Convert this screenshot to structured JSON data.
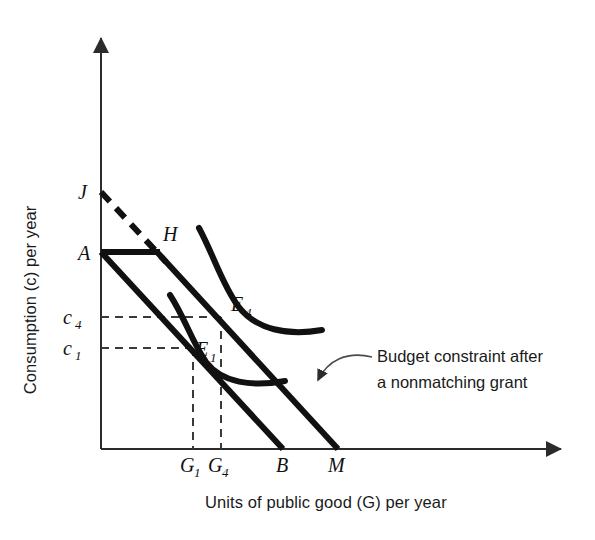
{
  "figure": {
    "background_color": "#ffffff",
    "line_color": "#111111",
    "axis_color": "#2b2b2b",
    "guide_color": "#3a3a3a"
  },
  "axes": {
    "y_title": "Consumption (c) per year",
    "x_title": "Units of public good (G) per year",
    "origin": {
      "x": 101,
      "y": 449
    },
    "x_axis_end": {
      "x": 566,
      "y": 449
    },
    "y_axis_top": {
      "x": 101,
      "y": 33
    }
  },
  "y_ticks": [
    {
      "label": "c",
      "sub": "4",
      "value_y": 317
    },
    {
      "label": "c",
      "sub": "1",
      "value_y": 348
    }
  ],
  "x_ticks": [
    {
      "label": "G",
      "sub": "1",
      "value_x": 193
    },
    {
      "label": "G",
      "sub": "4",
      "value_x": 221
    },
    {
      "label": "B",
      "sub": "",
      "value_x": 283
    },
    {
      "label": "M",
      "sub": "",
      "value_x": 338
    }
  ],
  "points": [
    {
      "name": "J",
      "label": "J",
      "sub": "",
      "x": 101,
      "y": 192,
      "label_x": 78,
      "label_y": 199
    },
    {
      "name": "A",
      "label": "A",
      "sub": "",
      "x": 101,
      "y": 252,
      "label_x": 78,
      "label_y": 260
    },
    {
      "name": "H",
      "label": "H",
      "sub": "",
      "x": 157,
      "y": 252,
      "label_x": 163,
      "label_y": 241
    },
    {
      "name": "E4",
      "label": "E",
      "sub": "4",
      "x": 221,
      "y": 317,
      "label_x": 231,
      "label_y": 311
    },
    {
      "name": "E1",
      "label": "E",
      "sub": "1",
      "x": 193,
      "y": 348,
      "label_x": 196,
      "label_y": 356
    },
    {
      "name": "B",
      "label": "B",
      "sub": "",
      "x": 283,
      "y": 449,
      "label_x": 277,
      "label_y": 472
    },
    {
      "name": "M",
      "label": "M",
      "sub": "",
      "x": 338,
      "y": 449,
      "label_x": 329,
      "label_y": 472
    }
  ],
  "lines": {
    "original_budget": {
      "name": "Original budget constraint A to B",
      "from": {
        "x": 101,
        "y": 252
      },
      "to": {
        "x": 283,
        "y": 449
      },
      "style": "solid"
    },
    "grant_budget": {
      "name": "Budget constraint after a nonmatching grant H to M",
      "from": {
        "x": 157,
        "y": 252
      },
      "to": {
        "x": 338,
        "y": 449
      },
      "style": "solid"
    },
    "grant_flat_segment": {
      "name": "Horizontal grant segment A to H",
      "from": {
        "x": 101,
        "y": 252
      },
      "to": {
        "x": 157,
        "y": 252
      },
      "style": "solid"
    },
    "virtual_extension": {
      "name": "Dashed virtual budget line J to H",
      "from": {
        "x": 101,
        "y": 192
      },
      "to": {
        "x": 166,
        "y": 262
      },
      "style": "dashed"
    }
  },
  "indifference_curves": [
    {
      "name": "indifference-curve-u1",
      "label": "E1 curve",
      "path": "M 170,295 C 185,318 192,342 206,362 C 222,383 252,387 285,381"
    },
    {
      "name": "indifference-curve-u4",
      "label": "E4 curve",
      "path": "M 199,228 C 214,256 222,284 238,306 C 256,330 288,336 322,330"
    }
  ],
  "annotation": {
    "line1": "Budget constraint after",
    "line2": "a nonmatching grant",
    "text_x": 377,
    "text_y1": 362,
    "text_y2": 388,
    "arrow_path": "M 370,357 C 345,352 327,360 317,381",
    "arrow_tip": {
      "x": 314,
      "y": 388
    }
  }
}
